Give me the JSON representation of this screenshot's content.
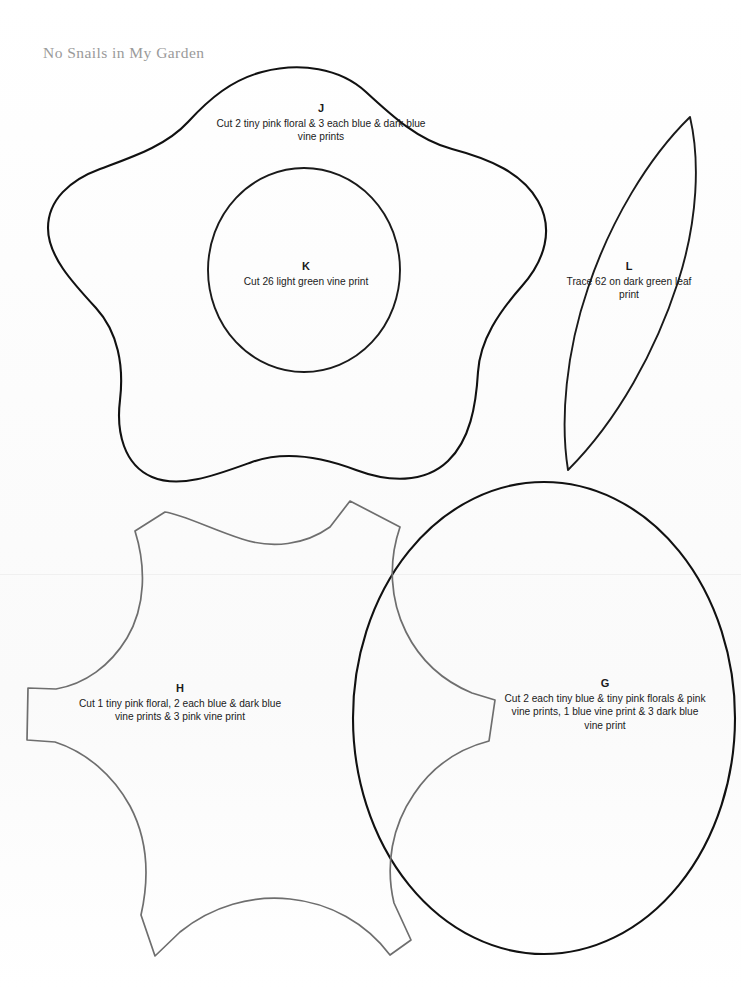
{
  "page": {
    "book_title": "No Snails in My Garden",
    "width": 741,
    "height": 989,
    "background_color": "#ffffff",
    "ink_dark": "#111111",
    "ink_gray": "#6e6e6e",
    "title_color": "#9a9a9a"
  },
  "pieces": [
    {
      "id": "J",
      "letter": "J",
      "description": "Cut 2 tiny pink floral & 3 each blue & dark blue vine prints",
      "outline_style": "dark",
      "shape": "five-lobed-flower"
    },
    {
      "id": "K",
      "letter": "K",
      "description": "Cut 26 light green vine print",
      "outline_style": "dark",
      "shape": "oval"
    },
    {
      "id": "L",
      "letter": "L",
      "description": "Trace 62 on dark green leaf print",
      "outline_style": "dark",
      "shape": "leaf"
    },
    {
      "id": "H",
      "letter": "H",
      "description": "Cut 1 tiny pink floral, 2 each blue & dark blue vine prints & 3 pink vine print",
      "outline_style": "gray",
      "shape": "concave-star"
    },
    {
      "id": "G",
      "letter": "G",
      "description": "Cut 2 each tiny blue & tiny pink florals & pink vine prints, 1 blue vine print & 3 dark blue vine print",
      "outline_style": "dark",
      "shape": "large-circle"
    }
  ]
}
